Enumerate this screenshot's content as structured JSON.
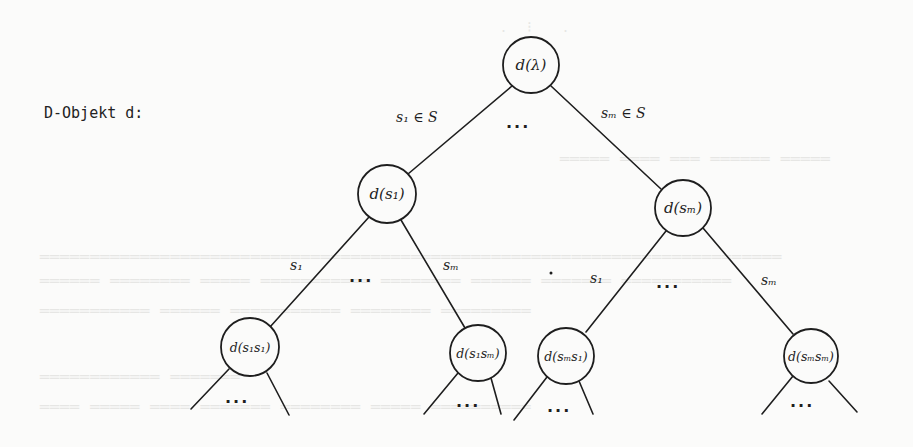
{
  "caption": "D-Objekt d:",
  "colors": {
    "ink": "#1e1e1e",
    "paper": "#fbfbfa",
    "ghost": "#e6e6e4"
  },
  "tree": {
    "root": {
      "label": "d(λ)",
      "cx": 531,
      "cy": 65,
      "r": 28
    },
    "level1": [
      {
        "id": "s1",
        "label": "d(s₁)",
        "cx": 387,
        "cy": 194,
        "r": 29
      },
      {
        "id": "sm",
        "label": "d(sₘ)",
        "cx": 683,
        "cy": 208,
        "r": 28
      }
    ],
    "level2": [
      {
        "id": "s1s1",
        "label": "d(s₁s₁)",
        "cx": 250,
        "cy": 347,
        "r": 29
      },
      {
        "id": "s1sm",
        "label": "d(s₁sₘ)",
        "cx": 478,
        "cy": 353,
        "r": 28
      },
      {
        "id": "sms1",
        "label": "d(sₘs₁)",
        "cx": 566,
        "cy": 356,
        "r": 28
      },
      {
        "id": "smsm",
        "label": "d(sₘsₘ)",
        "cx": 811,
        "cy": 356,
        "r": 27
      }
    ],
    "edge_labels": {
      "root_left": "s₁ ∈ S",
      "root_right": "sₘ ∈ S",
      "root_ellipsis": "...",
      "s1_left": "s₁",
      "s1_right": "sₘ",
      "s1_ellipsis": "...",
      "sm_left": "s₁",
      "sm_right": "sₘ",
      "sm_ellipsis": "...",
      "leaf_ellipsis": "..."
    }
  }
}
